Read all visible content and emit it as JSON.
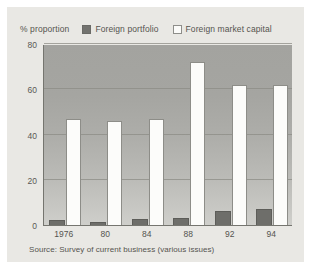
{
  "chart_data": {
    "type": "bar",
    "title": "",
    "subtitle": "",
    "xlabel": "",
    "ylabel": "% proportion",
    "ylim": [
      0,
      80
    ],
    "yticks": [
      0,
      20,
      40,
      60,
      80
    ],
    "grid": true,
    "legend_position": "top",
    "categories": [
      "1976",
      "80",
      "84",
      "88",
      "92",
      "94"
    ],
    "series": [
      {
        "name": "Foreign portfolio",
        "color": "#6e6e6a",
        "values": [
          2,
          1.5,
          2.5,
          3,
          6,
          7
        ]
      },
      {
        "name": "Foreign market capital",
        "color": "#fcfcfa",
        "values": [
          47,
          46,
          47,
          72,
          62,
          62
        ]
      }
    ],
    "annotations": {
      "source": "Source: Survey of current business (various issues)"
    }
  },
  "legend": {
    "axis_title": "% proportion",
    "entries": [
      {
        "label": "Foreign portfolio",
        "swatch": "dark-swatch"
      },
      {
        "label": "Foreign market capital",
        "swatch": "light-swatch"
      }
    ]
  },
  "axes": {
    "y_ticks": [
      "80",
      "60",
      "40",
      "20",
      "0"
    ],
    "x_ticks": [
      "1976",
      "80",
      "84",
      "88",
      "92",
      "94"
    ]
  },
  "source_note": "Source: Survey of current business (various issues)"
}
